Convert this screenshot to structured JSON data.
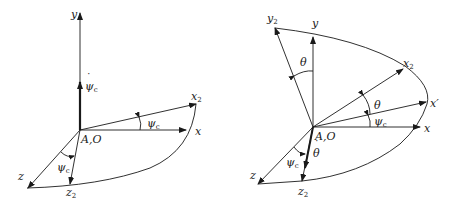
{
  "figure": {
    "stroke_color": "#1a1a1a",
    "background": "#ffffff",
    "left_panel": {
      "labels": {
        "y": "y",
        "psi_dot": "ψ",
        "psi_dot_sub": "c",
        "x2": "x",
        "x2_sub": "2",
        "x": "x",
        "origin": "A,O",
        "psi_xy": "ψ",
        "psi_xy_sub": "c",
        "psi_z": "ψ",
        "psi_z_sub": "c",
        "z": "z",
        "z2": "z",
        "z2_sub": "2"
      }
    },
    "right_panel": {
      "labels": {
        "y2": "y",
        "y2_sub": "2",
        "y": "y",
        "theta_y": "θ",
        "x2": "x",
        "x2_sub": "2",
        "theta_x": "θ",
        "x_prime": "x′",
        "psi_x": "ψ",
        "psi_x_sub": "c",
        "x": "x",
        "origin": "A,O",
        "theta_dot": "θ",
        "psi_z": "ψ",
        "psi_z_sub": "c",
        "z": "z",
        "z2": "z",
        "z2_sub": "2"
      }
    }
  }
}
